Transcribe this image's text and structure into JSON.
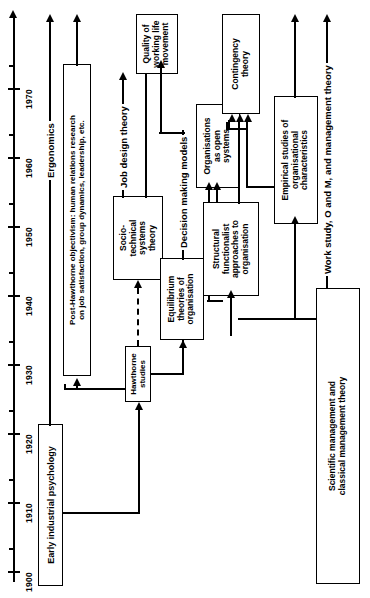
{
  "figure": {
    "orientation": "rotated-90-ccw",
    "line_color": "#000000",
    "background_color": "#ffffff"
  },
  "timeline": {
    "name": "decade-axis",
    "direction": "bottom-to-top",
    "years": [
      "1900",
      "1910",
      "1920",
      "1930",
      "1940",
      "1950",
      "1960",
      "1970"
    ]
  },
  "boxes": {
    "early_industrial_psychology": "Early industrial psychology",
    "post_hawthorne": "Post-Hawthorne objectivism: human relations research\non job satisfaction, group dynamics, leadership, etc.",
    "hawthorne_studies": "Hawthorne\nstudies",
    "socio_technical": "Socio-\ntechnical\nsystems\ntheory",
    "quality_working_life": "Quality of\nworking life\nmovement",
    "equilibrium_theories": "Equilibrium\ntheories of\norganisation",
    "organisations_open_systems": "Organisations\nas open\nsystems",
    "structural_functionalist": "Structural\nfunctionalist\napproaches to\norganisation",
    "contingency_theory": "Contingency\ntheory",
    "empirical_studies": "Empirical studies of\norganisational\ncharacteristics",
    "scientific_management": "Scientific management and\nclassical management theory"
  },
  "flow_labels": {
    "ergonomics": "Ergonomics",
    "job_design_theory": "Job design theory",
    "decision_making_models": "Decision making models",
    "work_study": "Work study, O and M, and management theory"
  }
}
